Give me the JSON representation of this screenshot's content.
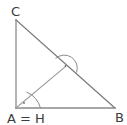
{
  "figure": {
    "background_color": "#ffffff",
    "canvas": {
      "width": 127,
      "height": 125
    },
    "labels": {
      "vertex_c": "C",
      "vertex_b": "B",
      "vertex_a_equals_h": "A = H"
    },
    "label_positions": {
      "vertex_c": {
        "x": 11,
        "y": 16
      },
      "vertex_b": {
        "x": 115,
        "y": 122
      },
      "vertex_a_equals_h": {
        "x": 7,
        "y": 123
      }
    },
    "points": {
      "C": {
        "x": 16,
        "y": 20
      },
      "A": {
        "x": 16,
        "y": 108
      },
      "B": {
        "x": 115,
        "y": 108
      },
      "F": {
        "x": 65,
        "y": 67
      }
    },
    "segments": [
      {
        "name": "side-ca-vertical-leg",
        "x1": 16,
        "y1": 20,
        "x2": 16,
        "y2": 108,
        "color": "#8a8a8a",
        "width": 1.3
      },
      {
        "name": "side-ab-horizontal-leg",
        "x1": 16,
        "y1": 108,
        "x2": 115,
        "y2": 108,
        "color": "#8a8a8a",
        "width": 1.3
      },
      {
        "name": "side-cb-hypotenuse",
        "x1": 16,
        "y1": 20,
        "x2": 115,
        "y2": 108,
        "color": "#7d7d7d",
        "width": 1.3
      },
      {
        "name": "altitude-a-to-f",
        "x1": 16,
        "y1": 108,
        "x2": 65,
        "y2": 67,
        "color": "#9a9a9a",
        "width": 1.1
      }
    ],
    "angle_marks": [
      {
        "name": "right-angle-mark-at-foot",
        "arc_path": "M 55.5 58.5 A 13 13 0 0 1 76.5 72.5",
        "dot": {
          "x": 65.5,
          "y": 66.0,
          "r": 0.9
        },
        "color": "#8a8a8a"
      },
      {
        "name": "right-angle-mark-at-vertex-a",
        "arc_path": "M 40.5 108 A 24.5 24.5 0 0 0 26.5 92.0",
        "dot": {
          "x": 24.0,
          "y": 103.0,
          "r": 0.9
        },
        "color": "#8a8a8a"
      }
    ],
    "colors": {
      "stroke": "#8a8a8a",
      "text": "#3a3a3a",
      "background": "#ffffff"
    }
  }
}
